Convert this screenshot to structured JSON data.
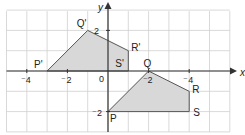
{
  "diagram": {
    "type": "coordinate-grid-transformation",
    "grid": {
      "x_min": -5,
      "x_max": 6,
      "y_min": -3,
      "y_max": 3,
      "unit": "1 square"
    },
    "axes": {
      "x_label": "x",
      "y_label": "y",
      "origin_label": "0",
      "x_ticks": [
        {
          "value": -4,
          "label": "⁻4"
        },
        {
          "value": -2,
          "label": "⁻2"
        },
        {
          "value": 2,
          "label": "⁻2"
        },
        {
          "value": 4,
          "label": "⁻4"
        }
      ],
      "y_ticks": [
        {
          "value": 2,
          "label": "2"
        },
        {
          "value": -2,
          "label": "⁻2"
        }
      ]
    },
    "shapes": [
      {
        "name": "image",
        "vertices": [
          {
            "label": "P'",
            "x": -3,
            "y": 0
          },
          {
            "label": "Q'",
            "x": -1,
            "y": 2
          },
          {
            "label": "R'",
            "x": 1,
            "y": 1
          },
          {
            "label": "S'",
            "x": 1,
            "y": 0
          }
        ]
      },
      {
        "name": "object",
        "vertices": [
          {
            "label": "P",
            "x": 0,
            "y": -2
          },
          {
            "label": "Q",
            "x": 2,
            "y": 0
          },
          {
            "label": "R",
            "x": 4,
            "y": -1
          },
          {
            "label": "S",
            "x": 4,
            "y": -2
          }
        ]
      }
    ],
    "colors": {
      "grid": "#cfcfcf",
      "axis": "#333333",
      "shape_fill": "#d8d8d8",
      "shape_stroke": "#555555",
      "text": "#222222"
    }
  }
}
